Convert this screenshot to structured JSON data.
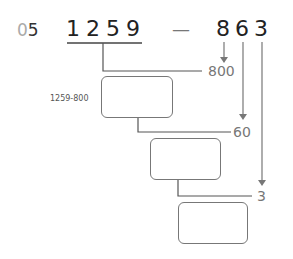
{
  "problem": {
    "number_prefix": "0",
    "number_suffix": "5",
    "minuend": "1259",
    "minuend_digits": [
      "1",
      "2",
      "5",
      "9"
    ],
    "operator": "—",
    "subtrahend_digits": [
      "8",
      "6",
      "3"
    ]
  },
  "decomposition": {
    "parts": [
      "800",
      "60",
      "3"
    ],
    "hint": "1259-800"
  },
  "boxes": [
    "",
    "",
    ""
  ]
}
